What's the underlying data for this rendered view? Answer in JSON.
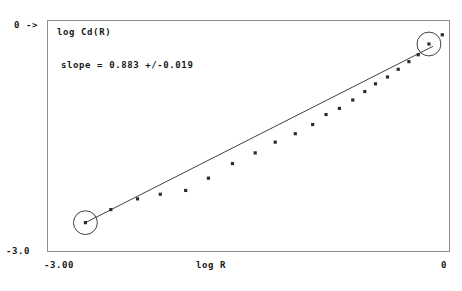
{
  "chart_data": {
    "type": "scatter",
    "title": "",
    "series_label": "log Cd(R)",
    "xlabel": "log R",
    "ylabel": "log Cd(R)",
    "xlim": [
      -3.0,
      0.0
    ],
    "ylim": [
      -3.0,
      0.0
    ],
    "x_tick_labels": [
      "-3.00",
      "0"
    ],
    "y_tick_labels": [
      "-3.0",
      "0 ->"
    ],
    "y_axis_max_marker": "0 ->",
    "y_axis_min_marker": "-3.0",
    "grid": false,
    "legend": "none",
    "annotations": [
      {
        "name": "slope-annotation",
        "text": "slope = 0.883 +/-0.019"
      }
    ],
    "fit": {
      "type": "line",
      "slope": 0.883,
      "slope_uncertainty": 0.019,
      "x_start": -2.72,
      "y_start": -2.63,
      "x_end": -0.12,
      "y_end": -0.33
    },
    "circled_points": [
      {
        "x": -2.72,
        "y": -2.63,
        "role": "scaling-range-lower-bound"
      },
      {
        "x": -0.15,
        "y": -0.3,
        "role": "scaling-range-upper-bound"
      }
    ],
    "points": [
      {
        "x": -2.72,
        "y": -2.63
      },
      {
        "x": -2.53,
        "y": -2.46
      },
      {
        "x": -2.33,
        "y": -2.32
      },
      {
        "x": -2.16,
        "y": -2.26
      },
      {
        "x": -1.97,
        "y": -2.21
      },
      {
        "x": -1.8,
        "y": -2.05
      },
      {
        "x": -1.62,
        "y": -1.86
      },
      {
        "x": -1.45,
        "y": -1.72
      },
      {
        "x": -1.3,
        "y": -1.58
      },
      {
        "x": -1.15,
        "y": -1.47
      },
      {
        "x": -1.02,
        "y": -1.35
      },
      {
        "x": -0.92,
        "y": -1.22
      },
      {
        "x": -0.82,
        "y": -1.14
      },
      {
        "x": -0.72,
        "y": -1.03
      },
      {
        "x": -0.63,
        "y": -0.92
      },
      {
        "x": -0.55,
        "y": -0.82
      },
      {
        "x": -0.46,
        "y": -0.73
      },
      {
        "x": -0.38,
        "y": -0.63
      },
      {
        "x": -0.3,
        "y": -0.53
      },
      {
        "x": -0.23,
        "y": -0.44
      },
      {
        "x": -0.15,
        "y": -0.3
      },
      {
        "x": -0.05,
        "y": -0.18
      }
    ]
  }
}
